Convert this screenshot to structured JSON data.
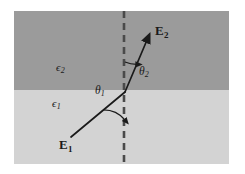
{
  "figure": {
    "kind": "refraction-diagram",
    "caption_text": "",
    "canvas": {
      "width": 245,
      "height": 174
    },
    "plot_area": {
      "x": 14,
      "y": 11,
      "width": 215,
      "height": 153
    },
    "interface_y": 90,
    "colors": {
      "background": "#ffffff",
      "medium_upper": "#9b9b9b",
      "medium_lower": "#d3d3d3",
      "ray": "#1a1a1a",
      "normal_line": "#4a4a4a",
      "text": "#1a1a1a"
    }
  },
  "media": {
    "upper": {
      "symbol": "ϵ",
      "subscript": "2",
      "label_x": 56,
      "label_y": 62
    },
    "lower": {
      "symbol": "ϵ",
      "subscript": "1",
      "label_x": 52,
      "label_y": 98
    }
  },
  "normal": {
    "name": "normal-dashed-line",
    "x": 124,
    "y_top": 11,
    "y_bottom": 164,
    "dash_pattern": "7,5",
    "width": 2.6
  },
  "rays": {
    "incident": {
      "name": "E",
      "subscript": "1",
      "x1": 71,
      "y1": 137,
      "x2": 125,
      "y2": 92,
      "label_x": 59,
      "label_y": 138
    },
    "refracted": {
      "name": "E",
      "subscript": "2",
      "x1": 125,
      "y1": 92,
      "x2": 150,
      "y2": 33,
      "label_x": 155,
      "label_y": 24
    }
  },
  "angles": {
    "theta1": {
      "symbol": "θ",
      "subscript": "1",
      "label_x": 95,
      "label_y": 85,
      "arc_radius": 28,
      "region": "below-interface-left-of-normal"
    },
    "theta2": {
      "symbol": "θ",
      "subscript": "2",
      "label_x": 139,
      "label_y": 66,
      "arc_radius": 30,
      "region": "above-interface-right-of-normal"
    }
  }
}
